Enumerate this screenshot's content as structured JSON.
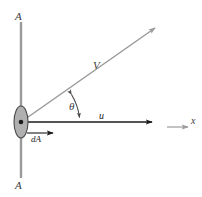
{
  "figure": {
    "type": "physics-vector-diagram",
    "labels": {
      "section_top": "A",
      "section_bottom": "A",
      "velocity_vector": "V",
      "axial_velocity": "u",
      "axis": "x",
      "angle": "θ",
      "area_element": "dA"
    },
    "colors": {
      "section_line": "#9a9a9a",
      "velocity_vector": "#9a9a9a",
      "axial_line": "#1b1b1b",
      "area_fill": "#b0b0b0",
      "area_stroke": "#4a4a4a",
      "center_dot": "#1b1b1b",
      "arc": "#4a4a4a",
      "axis_arrow": "#9a9a9a",
      "label_gray": "#3b3b3b",
      "label_dark": "#1b1b1b",
      "background": "#ffffff"
    },
    "geometry": {
      "origin": {
        "x": 21,
        "y": 122
      },
      "section_line": {
        "x": 21,
        "y_top": 22,
        "y_bottom": 178
      },
      "ellipse": {
        "cx": 21,
        "cy": 122,
        "rx": 7,
        "ry": 16
      },
      "velocity_tip": {
        "x": 155,
        "y": 28
      },
      "axial_tip": {
        "x": 152,
        "y": 122
      },
      "axis_arrow": {
        "x_start": 167,
        "x_end": 189,
        "y": 127
      },
      "area_arrow": {
        "x_start": 27,
        "x_end": 54,
        "y": 133
      },
      "angle_degrees": 35
    }
  }
}
